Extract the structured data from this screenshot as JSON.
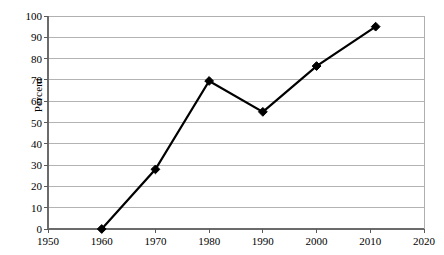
{
  "chart_data": {
    "type": "line",
    "title": "",
    "xlabel": "",
    "ylabel": "Percent",
    "xlim": [
      1950,
      2020
    ],
    "ylim": [
      0,
      100
    ],
    "grid": "horizontal",
    "legend": "none",
    "marker": "diamond",
    "line_color": "#000000",
    "marker_color": "#000000",
    "grid_color": "#b3b3b3",
    "frame_color": "#b0b0b0",
    "x_tick_labels": [
      "1950",
      "1960",
      "1970",
      "1980",
      "1990",
      "2000",
      "2010",
      "2020"
    ],
    "x_ticks": [
      1950,
      1960,
      1970,
      1980,
      1990,
      2000,
      2010,
      2020
    ],
    "y_tick_labels": [
      "0",
      "10",
      "20",
      "30",
      "40",
      "50",
      "60",
      "70",
      "80",
      "90",
      "100"
    ],
    "y_ticks": [
      0,
      10,
      20,
      30,
      40,
      50,
      60,
      70,
      80,
      90,
      100
    ],
    "series": [
      {
        "name": "Percent",
        "x": [
          1960,
          1970,
          1980,
          1990,
          2000,
          2011
        ],
        "values": [
          0,
          28,
          69.5,
          55,
          76.5,
          95
        ]
      }
    ]
  },
  "geometry": {
    "plot_left": 48,
    "plot_right": 424,
    "plot_top": 16,
    "plot_bottom": 229,
    "x_label_y": 236,
    "tick_len": 4
  }
}
